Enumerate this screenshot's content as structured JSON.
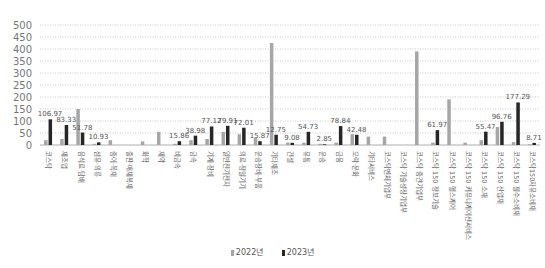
{
  "chart_data": {
    "type": "bar",
    "title": "",
    "xlabel": "",
    "ylabel": "",
    "ylim": [
      0,
      500
    ],
    "yticks": [
      0,
      50,
      100,
      150,
      200,
      250,
      300,
      350,
      400,
      450,
      500
    ],
    "grid": true,
    "legend_position": "bottom",
    "categories": [
      "코스닥",
      "제조업",
      "음식료·담배",
      "섬유·의류",
      "종이·목재",
      "출판·매체복제",
      "화학",
      "제약",
      "비금속",
      "금속",
      "기계·장비",
      "일반전기전자",
      "의료·정밀기기",
      "운송장비·부품",
      "기타제조",
      "건설",
      "유통",
      "운송",
      "금융",
      "오락·문화",
      "기타서비스",
      "코스닥벤처기업부",
      "코스닥 기술성장기업부",
      "코스닥 중견기업부",
      "코스닥 150 정보기술",
      "코스닥 150 헬스케어",
      "코스닥 150 커뮤니케이션서비스",
      "코스닥 150 소재",
      "코스닥 150 산업재",
      "코스닥 150 필수소비재",
      "코스닥150자유소비재"
    ],
    "series": [
      {
        "name": "2022년",
        "color": "#a6a6a6",
        "values": [
          20,
          25,
          150,
          5,
          20,
          0,
          15,
          55,
          5,
          20,
          25,
          55,
          45,
          30,
          425,
          10,
          10,
          5,
          10,
          45,
          35,
          35,
          0,
          390,
          10,
          190,
          10,
          20,
          75,
          12,
          3
        ]
      },
      {
        "name": "2023년",
        "color": "#262626",
        "values": [
          106.97,
          83.33,
          51.78,
          10.93,
          null,
          null,
          null,
          null,
          15.86,
          38.98,
          77.12,
          79.91,
          72.01,
          15.87,
          42.75,
          9.08,
          54.73,
          2.85,
          78.84,
          42.48,
          null,
          null,
          null,
          null,
          61.97,
          null,
          null,
          55.47,
          96.76,
          177.29,
          8.71
        ]
      }
    ],
    "data_labels": [
      "106.97",
      "83.33",
      "51.78",
      "10.93",
      "",
      "",
      "",
      "",
      "15.86",
      "38.98",
      "77.12",
      "79.91",
      "72.01",
      "15.87",
      "12.75",
      "9.08",
      "54.73",
      "2.85",
      "78.84",
      "42.48",
      "",
      "",
      "",
      "",
      "61.97",
      "",
      "",
      "55.47",
      "96.76",
      "177.29",
      "8.71"
    ]
  }
}
